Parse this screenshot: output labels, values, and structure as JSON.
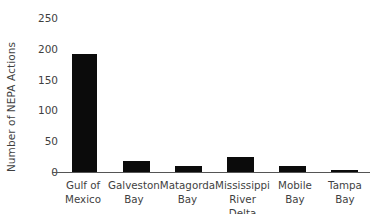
{
  "chart_data": {
    "type": "bar",
    "title": "",
    "xlabel": "",
    "ylabel": "Number of NEPA Actions",
    "categories": [
      "Gulf of Mexico",
      "Galveston Bay",
      "Matagorda Bay",
      "Mississippi River Delta",
      "Mobile Bay",
      "Tampa Bay"
    ],
    "category_lines": [
      [
        "Gulf of",
        "Mexico"
      ],
      [
        "Galveston",
        "Bay"
      ],
      [
        "Matagorda",
        "Bay"
      ],
      [
        "Mississippi",
        "River Delta"
      ],
      [
        "Mobile",
        "Bay"
      ],
      [
        "Tampa",
        "Bay"
      ]
    ],
    "values": [
      192,
      18,
      9,
      25,
      10,
      4
    ],
    "ylim": [
      0,
      250
    ],
    "yticks": [
      0,
      50,
      100,
      150,
      200,
      250
    ],
    "ytick_labels": [
      "0",
      "50",
      "100",
      "150",
      "200",
      "250"
    ],
    "grid": false,
    "legend": null,
    "bar_color": "#0b0b0b",
    "axis_color": "#555555",
    "text_color": "#3f3f3f",
    "background_color": "#ffffff"
  }
}
